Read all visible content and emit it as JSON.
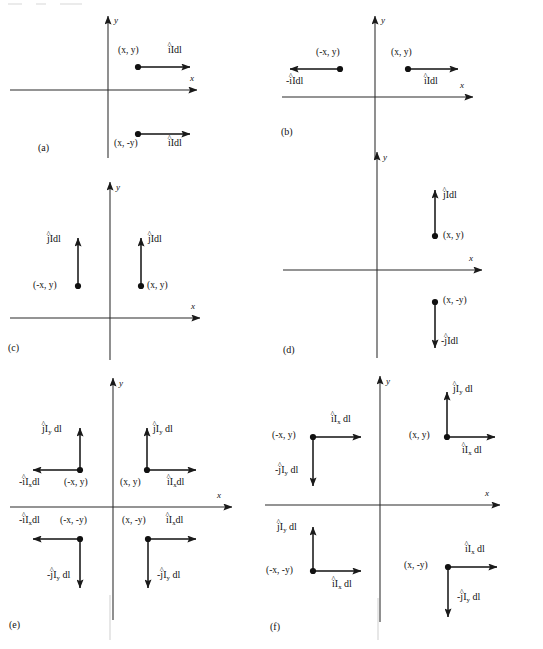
{
  "figure": {
    "type": "physics-vector-diagram",
    "width": 543,
    "height": 649,
    "stroke_color": "#1a1a1a",
    "background": "#ffffff",
    "axis_labels": {
      "x": "x",
      "y": "y"
    }
  },
  "panels": [
    {
      "id": "a",
      "label": "(a)",
      "axis": {
        "x": "x",
        "y": "y"
      },
      "elements": [
        {
          "point": "(x, y)",
          "vector": "îIdl",
          "direction": "right",
          "quadrant": "I"
        },
        {
          "point": "(x, -y)",
          "vector": "îIdl",
          "direction": "right",
          "quadrant": "IV"
        }
      ]
    },
    {
      "id": "b",
      "label": "(b)",
      "axis": {
        "x": "x",
        "y": "y"
      },
      "elements": [
        {
          "point": "(-x, y)",
          "vector": "-îIdl",
          "direction": "left",
          "quadrant": "II"
        },
        {
          "point": "(x, y)",
          "vector": "îIdl",
          "direction": "right",
          "quadrant": "I"
        }
      ]
    },
    {
      "id": "c",
      "label": "(c)",
      "axis": {
        "x": "x",
        "y": "y"
      },
      "elements": [
        {
          "point": "(-x, y)",
          "vector": "ĵIdl",
          "direction": "up",
          "quadrant": "II"
        },
        {
          "point": "(x, y)",
          "vector": "ĵIdl",
          "direction": "up",
          "quadrant": "I"
        }
      ]
    },
    {
      "id": "d",
      "label": "(d)",
      "axis": {
        "x": "x",
        "y": "y"
      },
      "elements": [
        {
          "point": "(x, y)",
          "vector": "ĵIdl",
          "direction": "up",
          "quadrant": "I"
        },
        {
          "point": "(x, -y)",
          "vector": "-ĵIdl",
          "direction": "down",
          "quadrant": "IV"
        }
      ]
    },
    {
      "id": "e",
      "label": "(e)",
      "axis": {
        "x": "x",
        "y": "y"
      },
      "elements": [
        {
          "point": "(-x, y)",
          "quadrant": "II",
          "vectors": [
            "ĵI_y dl up",
            "-îI_x dl left"
          ]
        },
        {
          "point": "(x, y)",
          "quadrant": "I",
          "vectors": [
            "ĵI_y dl up",
            "îI_x dl right"
          ]
        },
        {
          "point": "(-x, -y)",
          "quadrant": "III",
          "vectors": [
            "-îI_x dl left",
            "-ĵI_y dl down"
          ]
        },
        {
          "point": "(x, -y)",
          "quadrant": "IV",
          "vectors": [
            "îI_x dl right",
            "-ĵI_y dl down"
          ]
        }
      ]
    },
    {
      "id": "f",
      "label": "(f)",
      "axis": {
        "x": "x",
        "y": "y"
      },
      "elements": [
        {
          "point": "(-x, y)",
          "quadrant": "II",
          "vectors": [
            "îI_x dl right",
            "-ĵI_y dl down"
          ]
        },
        {
          "point": "(x, y)",
          "quadrant": "I",
          "vectors": [
            "ĵI_y dl up",
            "îI_x dl right"
          ]
        },
        {
          "point": "(-x, -y)",
          "quadrant": "III",
          "vectors": [
            "ĵI_y dl up",
            "îI_x dl right"
          ]
        },
        {
          "point": "(x, -y)",
          "quadrant": "IV",
          "vectors": [
            "îI_x dl right",
            "-ĵI_y dl down"
          ]
        }
      ]
    }
  ],
  "text": {
    "panel_a": "(a)",
    "panel_b": "(b)",
    "panel_c": "(c)",
    "panel_d": "(d)",
    "panel_e": "(e)",
    "panel_f": "(f)",
    "axis_x": "x",
    "axis_y": "y",
    "coord_xy": "(x, y)",
    "coord_negx_y": "(-x, y)",
    "coord_x_negy": "(x, -y)",
    "coord_negx_negy": "(-x, -y)",
    "i_unit": "i",
    "j_unit": "j",
    "hat": "^",
    "minus": "-",
    "Idl": "Idl",
    "I_sub": "I",
    "sub_x": "x",
    "sub_y": "y",
    "dl": "dl"
  }
}
